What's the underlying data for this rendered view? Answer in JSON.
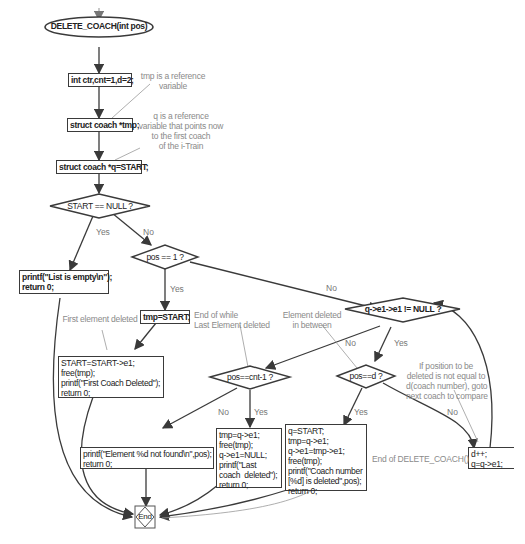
{
  "diagram": {
    "start_node": "DELETE_COACH(int pos)",
    "process": {
      "init": "int ctr,cnt=1,d=2;",
      "decl_tmp": "struct coach *tmp;",
      "decl_q": "struct coach *q=START;",
      "list_empty": "printf(\"List is empty\\n\");\nreturn 0;",
      "tmp_start": "tmp=START;",
      "delete_first": "START=START->e1;\nfree(tmp);\nprintf(\"First Coach Deleted\");\nreturn 0;",
      "not_found": "printf(\"Element %d not found\\n\",pos);\nreturn 0;",
      "delete_last": "tmp=q->e1;\nfree(tmp);\nq->e1=NULL;\nprintf(\"Last\ncoach  deleted\");\nreturn 0;",
      "delete_middle": "q=START;\ntmp=q->e1;\nq->e1=tmp->e1;\nfree(tmp);\nprintf(\"Coach number\n[%d] is deleted\",pos);\nreturn 0;",
      "advance": "d++;\nq=q->e1;"
    },
    "decisions": {
      "start_null": "START == NULL ?",
      "pos_one": "pos == 1 ?",
      "next_null": "q->e1->e1 != NULL ?",
      "pos_last": "pos==cnt-1 ?",
      "pos_d": "pos==d ?"
    },
    "edge_labels": {
      "yes": "Yes",
      "no": "No"
    },
    "annotations": {
      "tmp_ref": "tmp is a reference\nvariable",
      "q_ref": "q is a reference\nvariable that points now\nto the first coach\nof the i-Train",
      "first_deleted": "First element deleted",
      "end_while": "End of while\nLast Element deleted",
      "between": "Element deleted\nin between",
      "goto_next": "If position to be\ndeleted is not equal to\nd(coach number), goto\nnext coach to compare",
      "end_func": "End of DELETE_COACH()"
    },
    "end_node": "End",
    "colors": {
      "stroke": "#3a3a3a",
      "annotation": "#8a8a8a",
      "background": "#ffffff"
    }
  }
}
